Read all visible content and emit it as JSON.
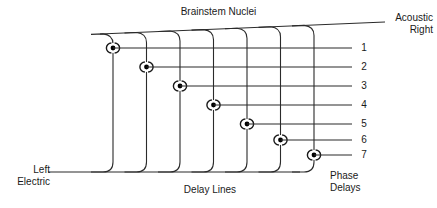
{
  "figure": {
    "title": "Brainstem Nuclei",
    "labels": {
      "acoustic_right": "Acoustic\nRight",
      "left_electric": "Left\nElectric",
      "delay_lines": "Delay Lines",
      "phase_delays": "Phase\nDelays"
    },
    "channel_numbers": [
      "1",
      "2",
      "3",
      "4",
      "5",
      "6",
      "7"
    ],
    "colors": {
      "line": "#2b2b2b",
      "background": "#ffffff",
      "text": "#1a1a1a",
      "nucleus_fill": "#000000"
    },
    "geometry": {
      "delay_line_x": [
        113,
        146.5,
        180,
        213.5,
        247,
        280.5,
        314
      ],
      "row_y": [
        48,
        67,
        86,
        105,
        124,
        140,
        155
      ],
      "top_diagonal": {
        "x1": 100,
        "y1": 34,
        "x2": 385,
        "y2": 22
      },
      "bottom_line": {
        "x1": 48,
        "y1": 172,
        "x2": 300,
        "y2": 172
      },
      "number_line_x_end": 352,
      "corner_radius": 10
    },
    "nuclei_count": 7,
    "nucleus_symbol": "nucleus-node"
  }
}
